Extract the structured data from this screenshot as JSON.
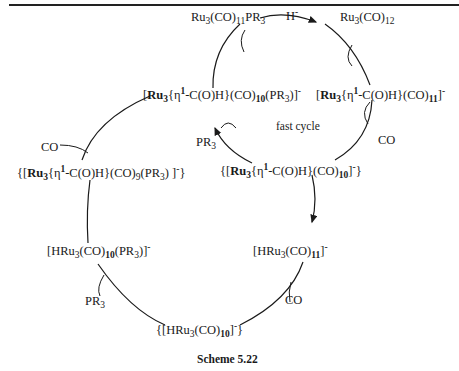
{
  "diagram": {
    "caption": "Scheme 5.22",
    "center_label": "fast cycle",
    "species": {
      "ru3co11pr3": "Ru3(CO)11PR3",
      "ru3co12": "Ru3(CO)12",
      "formyl_co11": "[Ru3{η1-C(O)H}(CO)11]-",
      "formyl_co10_pr3": "[Ru3{η1-C(O)H}(CO)10(PR3)]-",
      "formyl_co10": "{[Ru3{η1-C(O)H}(CO)10]-}",
      "formyl_co9_pr3": "{[Ru3{η1-C(O)H}(CO)9(PR3) ]-}",
      "hru3co11": "[HRu3(CO)11]-",
      "hru3co10_pr3": "[HRu3(CO)10(PR3)]-",
      "hru3co10": "{[HRu3(CO)10]-}"
    },
    "reagents": {
      "hydride": "H-",
      "co_loss_fast": "CO",
      "pr3_add_fast": "PR3",
      "co_loss_slow": "CO",
      "pr3_add_slow": "PR3",
      "co_add_slow": "CO"
    },
    "text": {
      "ru": "Ru",
      "three": "3",
      "co": "(CO)",
      "eleven": "11",
      "twelve": "12",
      "ten": "10",
      "nine": "9",
      "pr": "PR",
      "pr3_paren": "(PR",
      "close_paren": ")",
      "close_bracket_minus": "]",
      "minus": "-",
      "open_bracket": "[",
      "open_brace_bracket": "{[",
      "eta": "{η",
      "one": "1",
      "formyl": "-C(O)H}",
      "hru": "HRu",
      "h": "H",
      "close_all": "}"
    }
  }
}
